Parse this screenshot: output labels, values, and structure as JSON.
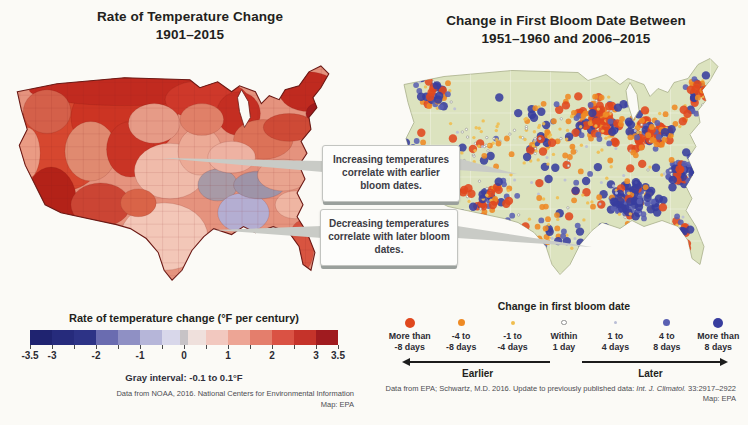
{
  "page": {
    "background": "#fbfaf6"
  },
  "left_panel": {
    "title_line1": "Rate of Temperature Change",
    "title_line2": "1901–2015",
    "legend": {
      "title": "Rate of temperature change (°F per century)",
      "segment_colors": [
        "#1f2370",
        "#262b7c",
        "#2d3386",
        "#6a6cb0",
        "#8f90c4",
        "#b6b6d9",
        "#d8d7ea",
        "#efe0dc",
        "#f2c8bf",
        "#eda595",
        "#e47e6c",
        "#da5244",
        "#c5332a",
        "#a01b1f"
      ],
      "gray_color": "#c7c3c6",
      "range_min": -3.5,
      "range_max": 3.5,
      "tick_step": 0.5,
      "tick_labels": [
        {
          "v": -3.5,
          "t": "-3.5"
        },
        {
          "v": -3,
          "t": "-3"
        },
        {
          "v": -2,
          "t": "-2"
        },
        {
          "v": -1,
          "t": "-1"
        },
        {
          "v": 0,
          "t": "0"
        },
        {
          "v": 1,
          "t": "1"
        },
        {
          "v": 2,
          "t": "2"
        },
        {
          "v": 3,
          "t": "3"
        },
        {
          "v": 3.5,
          "t": "3.5"
        }
      ],
      "gray_note": "Gray interval: -0.1 to 0.1°F"
    },
    "source_line1": "Data from NOAA, 2016. National Centers for Environmental Information",
    "source_line2": "Map: EPA"
  },
  "right_panel": {
    "title_line1": "Change in First Bloom Date Between",
    "title_line2": "1951–1960 and 2006–2015",
    "legend": {
      "title": "Change in first bloom date",
      "classes": [
        {
          "label_line1": "More than",
          "label_line2": "-8 days",
          "color": "#e0481e",
          "stroke": "none",
          "legend_r": 5
        },
        {
          "label_line1": "-4 to",
          "label_line2": "-8 days",
          "color": "#ee8a24",
          "stroke": "none",
          "legend_r": 3.5
        },
        {
          "label_line1": "-1 to",
          "label_line2": "-4 days",
          "color": "#f0bd4e",
          "stroke": "none",
          "legend_r": 2
        },
        {
          "label_line1": "Within",
          "label_line2": "1 day",
          "color": "#ffffff",
          "stroke": "#909090",
          "legend_r": 1.6
        },
        {
          "label_line1": "1 to",
          "label_line2": "4 days",
          "color": "#b9bdd6",
          "stroke": "none",
          "legend_r": 1.9
        },
        {
          "label_line1": "4 to",
          "label_line2": "8 days",
          "color": "#5a60b2",
          "stroke": "none",
          "legend_r": 3.5
        },
        {
          "label_line1": "More than",
          "label_line2": "8 days",
          "color": "#383d9e",
          "stroke": "none",
          "legend_r": 5
        }
      ],
      "earlier_label": "Earlier",
      "later_label": "Later"
    },
    "source_line1_prefix": "Data from EPA; Schwartz, M.D. 2016. Update to previously published data: ",
    "source_line1_italic": "Int. J. Climatol.",
    "source_line1_suffix": " 33:2917–2922",
    "source_line2": "Map: EPA"
  },
  "callouts": [
    {
      "text": "Increasing temperatures correlate with earlier bloom dates."
    },
    {
      "text": "Decreasing temperatures correlate with later bloom dates."
    }
  ],
  "maps": {
    "left": {
      "base_color": "#e5937e",
      "outline_color": "#6b1a16",
      "water_color": "#fbfaf6",
      "division_line_color": "rgba(130,30,25,0.30)",
      "patches": [
        [
          60,
          84,
          46,
          52,
          "#d6472f"
        ],
        [
          122,
          62,
          54,
          42,
          "#cc3423"
        ],
        [
          122,
          34,
          96,
          16,
          "#c12a1f"
        ],
        [
          205,
          44,
          42,
          20,
          "#ce382a"
        ],
        [
          237,
          58,
          22,
          22,
          "#c42e22"
        ],
        [
          308,
          36,
          30,
          20,
          "#bf2a1f"
        ],
        [
          321,
          58,
          16,
          12,
          "#a01a1c"
        ],
        [
          44,
          56,
          24,
          22,
          "#d4604a"
        ],
        [
          24,
          98,
          13,
          26,
          "#ea9b84"
        ],
        [
          88,
          96,
          26,
          30,
          "#e08a70"
        ],
        [
          48,
          148,
          26,
          36,
          "#b32218"
        ],
        [
          128,
          94,
          24,
          28,
          "#c93425"
        ],
        [
          98,
          150,
          30,
          22,
          "#cb4534"
        ],
        [
          152,
          68,
          26,
          20,
          "#e69b87"
        ],
        [
          168,
          116,
          36,
          28,
          "#f0bbaa"
        ],
        [
          162,
          182,
          44,
          34,
          "#f3c7b8"
        ],
        [
          198,
          96,
          22,
          24,
          "#ecaa96"
        ],
        [
          216,
          130,
          20,
          16,
          "#a89aa6"
        ],
        [
          242,
          158,
          26,
          20,
          "#b4aed2"
        ],
        [
          258,
          130,
          26,
          14,
          "#9e94a8"
        ],
        [
          282,
          120,
          26,
          16,
          "#e9a48f"
        ],
        [
          294,
          150,
          20,
          14,
          "#efb5a2"
        ],
        [
          300,
          192,
          13,
          26,
          "#d85440"
        ],
        [
          262,
          84,
          30,
          20,
          "#dc7258"
        ],
        [
          288,
          72,
          26,
          14,
          "#ce4a36"
        ],
        [
          230,
          102,
          24,
          16,
          "#eeb2a2"
        ],
        [
          136,
          148,
          18,
          14,
          "#d96448"
        ],
        [
          200,
          64,
          22,
          16,
          "#e08068"
        ]
      ]
    },
    "right": {
      "base_color": "#dce3bf",
      "outline_color": "#a8af8a",
      "water_color": "#fbfaf6",
      "state_line_color": "rgba(255,255,255,0.6)",
      "dot_opacity": 0.88,
      "map_radii": [
        4.2,
        2.9,
        1.7,
        1.2,
        1.5,
        2.9,
        4.2
      ],
      "mixes": {
        "orange": [
          0.3,
          0.27,
          0.15,
          0.04,
          0.04,
          0.09,
          0.11
        ],
        "blue": [
          0.05,
          0.07,
          0.08,
          0.04,
          0.08,
          0.27,
          0.41
        ],
        "mixed": [
          0.16,
          0.16,
          0.14,
          0.07,
          0.08,
          0.17,
          0.22
        ],
        "sparse": [
          0.08,
          0.18,
          0.28,
          0.12,
          0.12,
          0.11,
          0.11
        ]
      },
      "clusters": [
        [
          46,
          44,
          26,
          22,
          46,
          "mixed"
        ],
        [
          28,
          108,
          14,
          30,
          22,
          "mixed"
        ],
        [
          88,
          92,
          40,
          48,
          42,
          "sparse"
        ],
        [
          98,
          148,
          36,
          26,
          48,
          "orange"
        ],
        [
          150,
          88,
          36,
          40,
          55,
          "sparse"
        ],
        [
          205,
          72,
          42,
          32,
          115,
          "orange"
        ],
        [
          262,
          82,
          40,
          30,
          100,
          "orange"
        ],
        [
          310,
          46,
          22,
          28,
          50,
          "orange"
        ],
        [
          240,
          152,
          42,
          28,
          115,
          "blue"
        ],
        [
          293,
          122,
          30,
          22,
          70,
          "blue"
        ],
        [
          162,
          182,
          38,
          32,
          38,
          "sparse"
        ],
        [
          290,
          185,
          26,
          32,
          34,
          "mixed"
        ],
        [
          180,
          120,
          150,
          85,
          110,
          "sparse"
        ]
      ],
      "seed": 42
    }
  }
}
